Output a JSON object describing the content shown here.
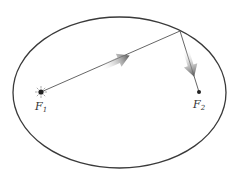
{
  "diagram": {
    "focus1": {
      "label": "F",
      "subscript": "1",
      "marker": "light-source"
    },
    "focus2": {
      "label": "F",
      "subscript": "2",
      "marker": "dot"
    },
    "arrows": [
      {
        "name": "incident-ray",
        "from": "focus1",
        "to": "ellipse-point"
      },
      {
        "name": "reflected-ray",
        "from": "ellipse-point",
        "to": "focus2"
      }
    ],
    "colors": {
      "outline": "#3a3a3a",
      "ray": "#555555",
      "arrow": "#6a6a6a"
    }
  }
}
